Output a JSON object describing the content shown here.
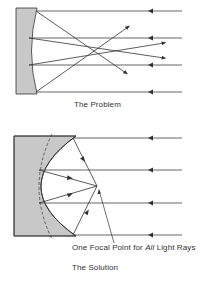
{
  "colors": {
    "mirror_fill": "#c8c8c8",
    "ray": "#333333",
    "text": "#333333"
  },
  "panels": [
    {
      "id": "problem",
      "caption": "The Problem",
      "mirror_type": "spherical",
      "incoming_rays": 4,
      "description": "Parallel rays reflecting off a spherical mirror cross at different points"
    },
    {
      "id": "solution",
      "caption": "The Solution",
      "mirror_type": "parabolic",
      "incoming_rays": 4,
      "callout": {
        "prefix": "One Focal Point for ",
        "emphasis": "All",
        "suffix": " Light Rays"
      },
      "description": "Parallel rays reflecting off a parabolic mirror converge at one focal point"
    }
  ]
}
